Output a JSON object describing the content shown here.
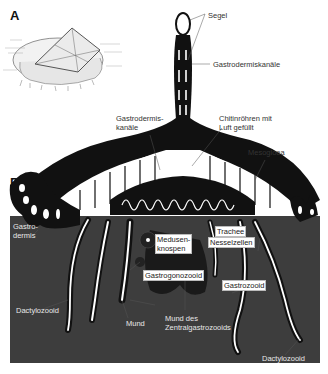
{
  "figure": {
    "panels": [
      {
        "id": "A",
        "label": "A"
      },
      {
        "id": "B",
        "label": "B"
      }
    ],
    "colors": {
      "background": "#ffffff",
      "water": "#3d3d3d",
      "tissue": "#111111",
      "chambers": "#ffffff",
      "label_text": "#333333",
      "label_on_dark": "#e8e8e8"
    }
  },
  "labels": {
    "segel": "Segel",
    "gastrodermiskanaele_top": "Gastrodermiskanäle",
    "gastrodermiskanaele_left_l1": "Gastrodermis-",
    "gastrodermiskanaele_left_l2": "kanäle",
    "chitinroehren_l1": "Chitinröhren mit",
    "chitinroehren_l2": "Luft gefüllt",
    "mesogloea": "Mesogloea",
    "gastrodermis_l1": "Gastro-",
    "gastrodermis_l2": "dermis",
    "medusenknospen_l1": "Medusen-",
    "medusenknospen_l2": "knospen",
    "trachee": "Trachee",
    "nesselzellen": "Nesselzellen",
    "gastrogonozooid": "Gastrogonozooid",
    "gastrozooid": "Gastrozooid",
    "dactylozooid_left": "Dactylozooid",
    "mund": "Mund",
    "mund_zentral_l1": "Mund des",
    "mund_zentral_l2": "Zentralgastrozooids",
    "dactylozooid_right": "Dactylozooid"
  }
}
